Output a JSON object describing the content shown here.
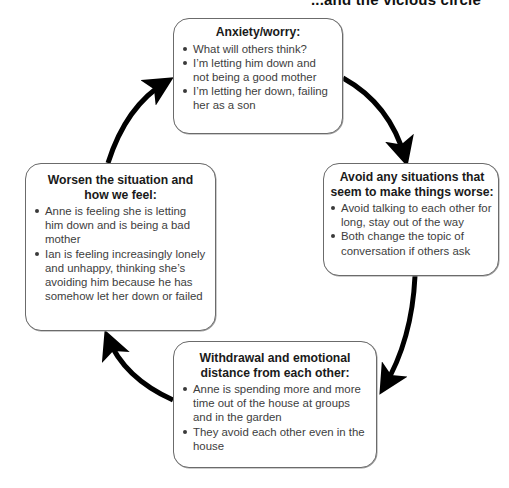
{
  "diagram": {
    "partial_heading": "...and the vicious circle",
    "type": "cycle",
    "arrow_color": "#000000",
    "box_border_color": "#6b6b6b",
    "nodes": {
      "top": {
        "title": "Anxiety/worry:",
        "items": [
          "What will others think?",
          "I’m letting him down and not being a good mother",
          "I’m letting her down, failing her as a son"
        ]
      },
      "right": {
        "title": "Avoid any situations that seem to make things worse:",
        "items": [
          "Avoid talking to each other for long, stay out of the way",
          "Both change the topic of conversation if others ask"
        ]
      },
      "bottom": {
        "title": "Withdrawal and emotional distance from each other:",
        "items": [
          "Anne is spending more and more time out of the house at groups and in the garden",
          "They avoid each other even in the house"
        ]
      },
      "left": {
        "title": "Worsen the situation and how we feel:",
        "items": [
          "Anne is feeling she is letting him down and is being a bad mother",
          "Ian is feeling increasingly lonely and unhappy, thinking she’s avoiding him because he has somehow let her down or failed"
        ]
      }
    },
    "edges": [
      {
        "from": "top",
        "to": "right"
      },
      {
        "from": "right",
        "to": "bottom"
      },
      {
        "from": "bottom",
        "to": "left"
      },
      {
        "from": "left",
        "to": "top"
      }
    ]
  }
}
